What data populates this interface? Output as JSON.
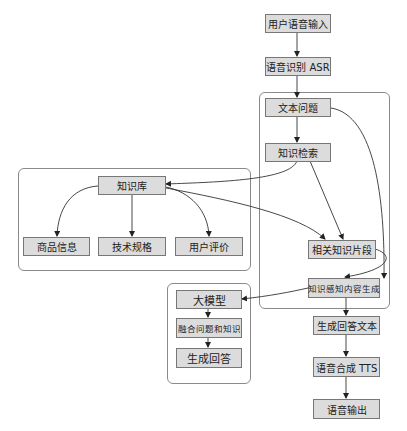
{
  "diagram": {
    "type": "flowchart",
    "nodes": {
      "user_voice_input": "用户语音输入",
      "asr": "语音识别 ASR",
      "text_question": "文本问题",
      "knowledge_retrieval": "知识检索",
      "knowledge_base": "知识库",
      "product_info": "商品信息",
      "tech_specs": "技术规格",
      "user_reviews": "用户评价",
      "relevant_snippets": "相关知识片段",
      "knowledge_aware_generation": "知识感知内容生成",
      "llm": "大模型",
      "fuse_question_knowledge": "融合问题和知识",
      "generate_answer": "生成回答",
      "answer_text": "生成回答文本",
      "tts": "语音合成 TTS",
      "voice_output": "语音输出"
    },
    "edges": [
      [
        "用户语音输入",
        "语音识别 ASR"
      ],
      [
        "语音识别 ASR",
        "文本问题"
      ],
      [
        "文本问题",
        "知识检索"
      ],
      [
        "文本问题",
        "知识感知内容生成"
      ],
      [
        "知识检索",
        "知识库"
      ],
      [
        "知识检索",
        "相关知识片段"
      ],
      [
        "知识库",
        "商品信息"
      ],
      [
        "知识库",
        "技术规格"
      ],
      [
        "知识库",
        "用户评价"
      ],
      [
        "知识库",
        "相关知识片段"
      ],
      [
        "相关知识片段",
        "知识感知内容生成"
      ],
      [
        "知识感知内容生成",
        "大模型"
      ],
      [
        "知识感知内容生成",
        "生成回答文本"
      ],
      [
        "大模型",
        "融合问题和知识"
      ],
      [
        "融合问题和知识",
        "生成回答"
      ],
      [
        "生成回答文本",
        "语音合成 TTS"
      ],
      [
        "语音合成 TTS",
        "语音输出"
      ]
    ],
    "colors": {
      "node_fill": "#dcdcdc",
      "node_border": "#777777",
      "edge": "#222222",
      "cluster_border": "#8a8a8a"
    }
  }
}
